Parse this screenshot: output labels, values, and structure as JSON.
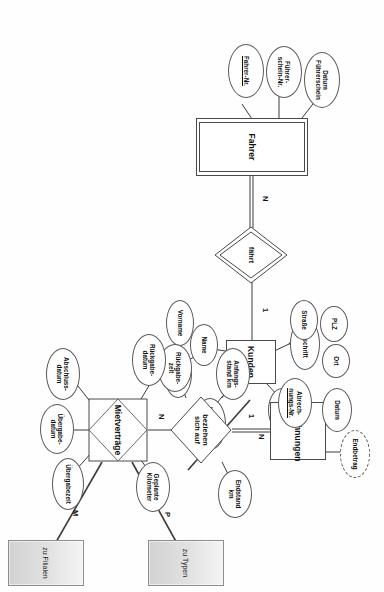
{
  "diagram": {
    "type": "entity-relationship",
    "orientation": "rotated-90-clockwise",
    "background": "#ffffff",
    "line_color": "#3a3a3a"
  },
  "entities": [
    {
      "id": "fahrer",
      "label": "Fahrer",
      "kind": "weak-entity",
      "attributes": [
        {
          "label": "Fahrer-Nr.",
          "key": true,
          "derived": false
        },
        {
          "label": "Führer-\nschein-Nr.",
          "key": false,
          "derived": false
        },
        {
          "label": "Datum\nFührerschein",
          "key": false,
          "derived": false
        }
      ]
    },
    {
      "id": "kunden",
      "label": "Kunden",
      "kind": "entity",
      "attributes": [
        {
          "label": "Kunden-Nr.",
          "key": true,
          "derived": false
        },
        {
          "label": "Name",
          "key": false,
          "derived": false
        },
        {
          "label": "Vorname",
          "key": false,
          "derived": false
        },
        {
          "label": "Nachname",
          "key": false,
          "derived": false
        },
        {
          "label": "Anschrift",
          "key": false,
          "derived": false
        },
        {
          "label": "Straße",
          "key": false,
          "derived": false
        },
        {
          "label": "PLZ",
          "key": false,
          "derived": false
        },
        {
          "label": "Ort",
          "key": false,
          "derived": false
        },
        {
          "label": "Telefon",
          "key": false,
          "derived": false
        },
        {
          "label": "Vorwahl",
          "key": false,
          "derived": false
        }
      ]
    },
    {
      "id": "abrechnungen",
      "label": "Abrechnungen",
      "kind": "entity",
      "attributes": [
        {
          "label": "Abrech-\nnungs-Nr.",
          "key": true,
          "derived": false
        },
        {
          "label": "Datum",
          "key": false,
          "derived": false
        },
        {
          "label": "Endbetrag",
          "key": false,
          "derived": true
        }
      ]
    }
  ],
  "relationships": [
    {
      "id": "faehrt",
      "label": "fährt",
      "kind": "identifying-relationship",
      "attributes": []
    },
    {
      "id": "beziehen_sich_auf",
      "label": "beziehen\nsich auf",
      "kind": "relationship",
      "attributes": [
        {
          "label": "Anfangs-\nstand km"
        },
        {
          "label": "Endstand\nkm"
        },
        {
          "label": "Rückgabe-\nzeit"
        }
      ]
    },
    {
      "id": "mietvertraege",
      "label": "Mietverträge",
      "kind": "associative-entity",
      "attributes": [
        {
          "label": "Rückgabe-\ndatum"
        },
        {
          "label": "Abschluss-\ndatum"
        },
        {
          "label": "Übergabe-\ndatum"
        },
        {
          "label": "Übergabezeit"
        },
        {
          "label": "Geplante\nKilometer"
        }
      ]
    }
  ],
  "cardinalities": [
    {
      "id": "card_fahrer_faehrt",
      "value": "N"
    },
    {
      "id": "card_kunden_faehrt",
      "value": "1"
    },
    {
      "id": "card_abrechnungen",
      "value": "1"
    },
    {
      "id": "card_mietvertraege_bez",
      "value": "N"
    },
    {
      "id": "card_kunden_miet",
      "value": "N"
    },
    {
      "id": "card_typen",
      "value": "P"
    },
    {
      "id": "card_filialen",
      "value": "M"
    }
  ],
  "offpage_refs": [
    {
      "id": "zu_typen",
      "label": "zu Typen"
    },
    {
      "id": "zu_filialen",
      "label": "zu Filialen"
    }
  ],
  "labels": {
    "fahrer": "Fahrer",
    "kunden": "Kunden",
    "abrechnungen": "Abrechnungen",
    "faehrt": "fährt",
    "beziehen_l1": "beziehen",
    "beziehen_l2": "sich auf",
    "mietvertraege": "Mietverträge",
    "fahrer_nr": "Fahrer-Nr.",
    "fuehrerschein_nr_l1": "Führer-",
    "fuehrerschein_nr_l2": "schein-Nr.",
    "datum_fuehrerschein_l1": "Datum",
    "datum_fuehrerschein_l2": "Führerschein",
    "abrech_nr_l1": "Abrech-",
    "abrech_nr_l2": "nungs-Nr.",
    "datum": "Datum",
    "endbetrag": "Endbetrag",
    "anfangsstand_l1": "Anfangs-",
    "anfangsstand_l2": "stand km",
    "endstand_l1": "Endstand",
    "endstand_l2": "km",
    "rueckgabezeit_l1": "Rückgabe-",
    "rueckgabezeit_l2": "zeit",
    "rueckgabedatum_l1": "Rückgabe-",
    "rueckgabedatum_l2": "datum",
    "geplante_km_l1": "Geplante",
    "geplante_km_l2": "Kilometer",
    "abschlussdatum_l1": "Abschluss-",
    "abschlussdatum_l2": "datum",
    "uebergabedatum_l1": "Übergabe-",
    "uebergabedatum_l2": "datum",
    "uebergabezeit": "Übergabezeit",
    "kunden_nr": "Kunden-Nr.",
    "name": "Name",
    "vorname": "Vorname",
    "nachname": "Nachname",
    "anschrift": "Anschrift",
    "strasse": "Straße",
    "plz": "PLZ",
    "ort": "Ort",
    "telefon": "Telefon",
    "vorwahl": "Vorwahl",
    "zu_typen": "zu Typen",
    "zu_filialen": "zu Filialen",
    "card_n1": "N",
    "card_1a": "1",
    "card_1b": "1",
    "card_n2": "N",
    "card_n3": "N",
    "card_p": "P",
    "card_m": "M"
  }
}
